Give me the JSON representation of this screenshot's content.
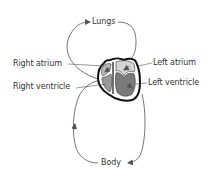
{
  "diagram": {
    "type": "circulation-double-loop",
    "labels": {
      "lungs": "Lungs",
      "body": "Body",
      "right_atrium": "Right atrium",
      "right_ventricle": "Right ventricle",
      "left_atrium": "Left atrium",
      "left_ventricle": "Left ventricle"
    },
    "colors": {
      "line": "#555555",
      "heart_outline": "#111111",
      "chamber_fill_dark": "#7a7a7a",
      "chamber_fill_light": "#c8c8c8",
      "text": "#333333"
    }
  }
}
